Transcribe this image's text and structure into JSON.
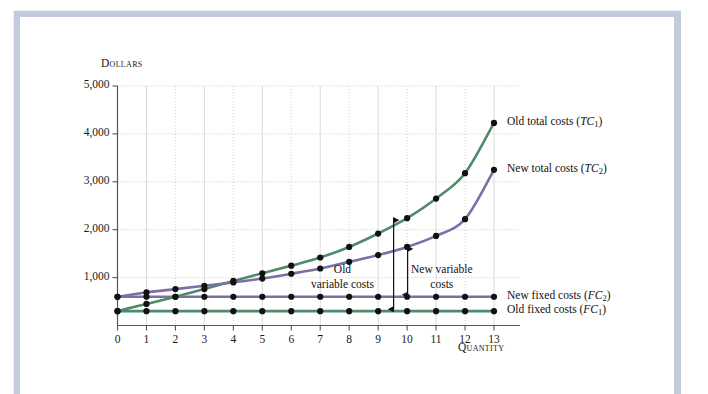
{
  "figure": {
    "frame_color": "#c2ccdc",
    "background": "#ffffff"
  },
  "chart_data": {
    "type": "line",
    "title": "",
    "xlabel": "Quantity",
    "ylabel": "Dollars",
    "xlim": [
      0,
      13
    ],
    "ylim": [
      0,
      5000
    ],
    "grid": true,
    "legend_position": "right-inline",
    "y_ticks": [
      "1,000",
      "2,000",
      "3,000",
      "4,000",
      "5,000"
    ],
    "y_tick_values": [
      1000,
      2000,
      3000,
      4000,
      5000
    ],
    "x_ticks": [
      "0",
      "1",
      "2",
      "3",
      "4",
      "5",
      "6",
      "7",
      "8",
      "9",
      "10",
      "11",
      "12",
      "13"
    ],
    "x_tick_values": [
      0,
      1,
      2,
      3,
      4,
      5,
      6,
      7,
      8,
      9,
      10,
      11,
      12,
      13
    ],
    "x": [
      0,
      1,
      2,
      3,
      4,
      5,
      6,
      7,
      8,
      9,
      10,
      11,
      12,
      13
    ],
    "series": [
      {
        "name": "Old total costs (TC1)",
        "label_main": "Old total costs (",
        "label_sym": "TC",
        "label_sub": "1",
        "label_end": ")",
        "color": "#4f8a6a",
        "markers": true,
        "values": [
          300,
          450,
          600,
          760,
          930,
          1090,
          1250,
          1420,
          1640,
          1920,
          2240,
          2650,
          3180,
          4230
        ]
      },
      {
        "name": "New total costs (TC2)",
        "label_main": "New total costs (",
        "label_sym": "TC",
        "label_sub": "2",
        "label_end": ")",
        "color": "#7c6fa8",
        "markers": true,
        "values": [
          600,
          690,
          760,
          830,
          900,
          980,
          1080,
          1190,
          1330,
          1470,
          1640,
          1870,
          2220,
          3250
        ]
      },
      {
        "name": "New fixed costs (FC2)",
        "label_main": "New fixed costs (",
        "label_sym": "FC",
        "label_sub": "2",
        "label_end": ")",
        "color": "#7c6fa8",
        "markers": true,
        "values": [
          600,
          600,
          600,
          600,
          600,
          600,
          600,
          600,
          600,
          600,
          600,
          600,
          600,
          600
        ]
      },
      {
        "name": "Old fixed costs (FC1)",
        "label_main": "Old fixed costs (",
        "label_sym": "FC",
        "label_sub": "1",
        "label_end": ")",
        "color": "#4f8a6a",
        "markers": true,
        "values": [
          300,
          300,
          300,
          300,
          300,
          300,
          300,
          300,
          300,
          300,
          300,
          300,
          300,
          300
        ]
      }
    ],
    "annotations": [
      {
        "id": "old-variable-costs",
        "line1": "Old",
        "line2": "variable costs",
        "arrow": "double-headed vertical at quantity 10 from Old fixed costs to Old total costs",
        "at_x": 10,
        "from_value": 300,
        "to_value": 2240
      },
      {
        "id": "new-variable-costs",
        "line1": "New variable",
        "line2": "costs",
        "arrow": "double-headed vertical at quantity 10 from New fixed costs to New total costs",
        "at_x": 10,
        "from_value": 600,
        "to_value": 1640
      }
    ]
  }
}
